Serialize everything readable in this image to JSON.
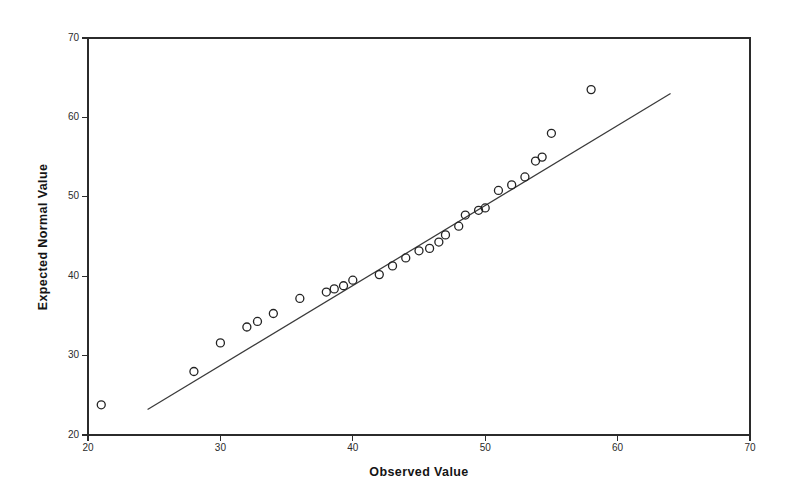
{
  "figure": {
    "background_color": "#ffffff",
    "foreground_color": "#2b2b2b",
    "marker_color": "#232323",
    "line_color": "#3a3a3a"
  },
  "chart_data": {
    "type": "scatter",
    "title": "",
    "subtitle": "",
    "xlabel": "Observed Value",
    "ylabel": "Expected Normal Value",
    "xlim": [
      20,
      70
    ],
    "ylim": [
      20,
      70
    ],
    "xticks": [
      20,
      30,
      40,
      50,
      60,
      70
    ],
    "yticks": [
      20,
      30,
      40,
      50,
      60,
      70
    ],
    "xtick_labels": [
      "20",
      "30",
      "40",
      "50",
      "60",
      "70"
    ],
    "ytick_labels": [
      "20",
      "30",
      "40",
      "50",
      "60",
      "70"
    ],
    "grid": false,
    "legend": null,
    "legend_position": "none",
    "annotations": [],
    "series": [
      {
        "name": "Q-Q points",
        "marker": "open-circle",
        "x": [
          21.0,
          28.0,
          30.0,
          32.0,
          32.8,
          34.0,
          36.0,
          38.0,
          38.6,
          39.3,
          40.0,
          42.0,
          43.0,
          44.0,
          45.0,
          45.8,
          46.5,
          47.0,
          48.0,
          48.5,
          49.5,
          50.0,
          51.0,
          52.0,
          53.0,
          53.8,
          54.3,
          55.0,
          58.0
        ],
        "y": [
          23.8,
          28.0,
          31.6,
          33.6,
          34.3,
          35.3,
          37.2,
          38.0,
          38.4,
          38.8,
          39.5,
          40.2,
          41.3,
          42.3,
          43.2,
          43.5,
          44.3,
          45.2,
          46.3,
          47.7,
          48.3,
          48.6,
          50.8,
          51.5,
          52.5,
          54.5,
          55.0,
          58.0,
          63.5
        ]
      },
      {
        "name": "Reference line",
        "marker": "none",
        "type": "line",
        "x": [
          24.5,
          64.0
        ],
        "y": [
          23.2,
          63.0
        ]
      }
    ]
  }
}
